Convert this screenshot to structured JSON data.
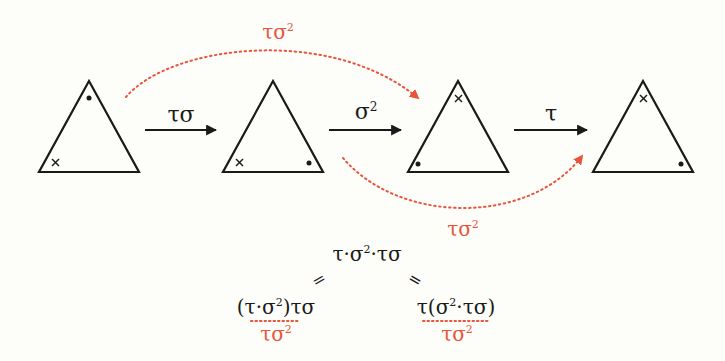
{
  "colors": {
    "background": "#fdfdf9",
    "ink": "#1a1a1a",
    "accent": "#e8553c"
  },
  "triangles": [
    {
      "id": 1,
      "top_mark": "dot",
      "bottom_left_mark": "cross",
      "bottom_right_mark": ""
    },
    {
      "id": 2,
      "top_mark": "",
      "bottom_left_mark": "cross",
      "bottom_right_mark": "dot"
    },
    {
      "id": 3,
      "top_mark": "cross",
      "bottom_left_mark": "dot",
      "bottom_right_mark": ""
    },
    {
      "id": 4,
      "top_mark": "cross",
      "bottom_left_mark": "",
      "bottom_right_mark": "dot"
    }
  ],
  "arrows": [
    {
      "from": 1,
      "to": 2,
      "label_base": "τσ",
      "label_sup": ""
    },
    {
      "from": 2,
      "to": 3,
      "label_base": "σ",
      "label_sup": "2"
    },
    {
      "from": 3,
      "to": 4,
      "label_base": "τ",
      "label_sup": ""
    }
  ],
  "curved_arrows": [
    {
      "from": 1,
      "to": 3,
      "position": "top",
      "label_base": "τσ",
      "label_sup": "2"
    },
    {
      "from": 2,
      "to": 4,
      "position": "bottom",
      "label_base": "τσ",
      "label_sup": "2"
    }
  ],
  "equation": {
    "top": {
      "base": "τ·σ",
      "sup": "2",
      "rest": "·τσ"
    },
    "equals_left": "=",
    "equals_right": "=",
    "left": {
      "open": "(τ·σ",
      "sup": "2",
      "close": ")τσ",
      "under_base": "τσ",
      "under_sup": "2"
    },
    "right": {
      "pre": "τ(σ",
      "sup": "2",
      "post": "·τσ)",
      "under_base": "τσ",
      "under_sup": "2"
    }
  }
}
